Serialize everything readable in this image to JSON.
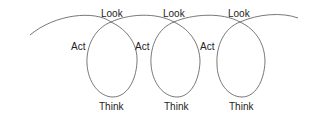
{
  "diagram": {
    "type": "coil-cycle",
    "stroke_color": "#555555",
    "text_color": "#222222",
    "cycles": [
      {
        "look": "Look",
        "act": "Act",
        "think": "Think"
      },
      {
        "look": "Look",
        "act": "Act",
        "think": "Think"
      },
      {
        "look": "Look",
        "act": "Act",
        "think": "Think"
      }
    ]
  }
}
